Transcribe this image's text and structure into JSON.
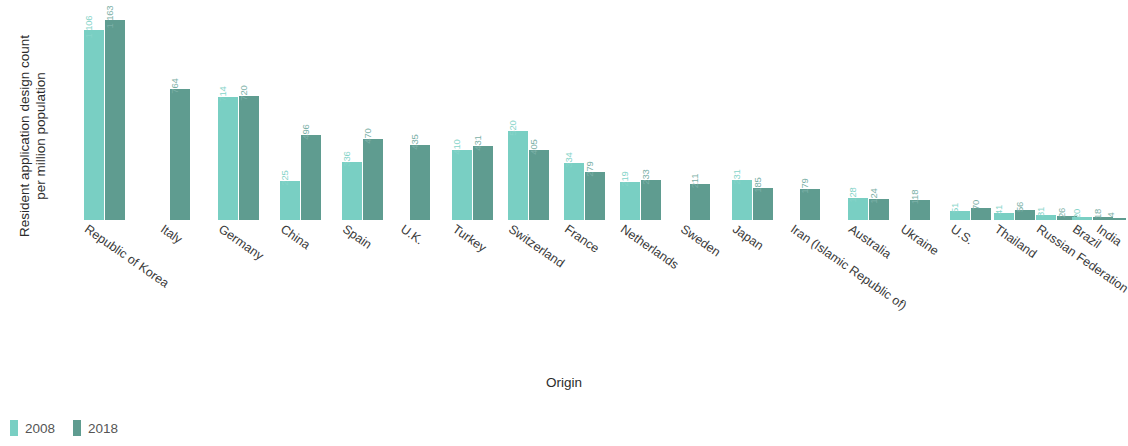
{
  "chart_data": {
    "type": "bar",
    "title": "",
    "xlabel": "Origin",
    "ylabel": "Resident application design count\nper million population",
    "ylim": [
      0,
      1200
    ],
    "grid": false,
    "legend_position": "bottom-left",
    "colors": {
      "2008": "#79cfc3",
      "2018": "#5f9c90"
    },
    "categories": [
      "Republic of Korea",
      "Italy",
      "Germany",
      "China",
      "Spain",
      "U.K.",
      "Turkey",
      "Switzerland",
      "France",
      "Netherlands",
      "Sweden",
      "Japan",
      "Iran (Islamic Republic of)",
      "Australia",
      "Ukraine",
      "U.S.",
      "Thailand",
      "Russian Federation",
      "Brazil",
      "India"
    ],
    "series": [
      {
        "name": "2008",
        "values": [
          1106,
          null,
          714,
          225,
          336,
          null,
          410,
          520,
          334,
          219,
          null,
          231,
          null,
          128,
          null,
          51,
          41,
          31,
          20,
          null
        ],
        "labels": [
          "1 106",
          "",
          "714",
          "225",
          "336",
          "",
          "410",
          "520",
          "334",
          "219",
          "",
          "231",
          "",
          "128",
          "",
          "51",
          "41",
          "31",
          "20",
          ""
        ]
      },
      {
        "name": "2018",
        "values": [
          1163,
          764,
          720,
          496,
          470,
          435,
          431,
          405,
          279,
          233,
          211,
          185,
          179,
          124,
          118,
          70,
          56,
          26,
          18,
          4
        ],
        "labels": [
          "1 163",
          "764",
          "720",
          "496",
          "470",
          "435",
          "431",
          "405",
          "279",
          "233",
          "211",
          "185",
          "179",
          "124",
          "118",
          "70",
          "56",
          "26",
          "18",
          "4"
        ]
      }
    ]
  },
  "legend": {
    "items": [
      {
        "label": "2008",
        "key": "y2008"
      },
      {
        "label": "2018",
        "key": "y2018"
      }
    ]
  },
  "axes": {
    "x_title": "Origin",
    "y_title": "Resident application design count\nper million population"
  }
}
